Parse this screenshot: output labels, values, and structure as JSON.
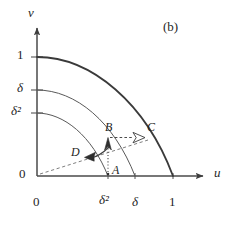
{
  "figure": {
    "panel_label": "(b)",
    "axes": {
      "x_axis_name": "u",
      "y_axis_name": "v",
      "origin_label": "0",
      "x_ticks": [
        {
          "label": "0",
          "value": 0,
          "px": 37
        },
        {
          "label": "δ²",
          "value": 0.52,
          "px": 108
        },
        {
          "label": "δ",
          "value": 0.72,
          "px": 135
        },
        {
          "label": "1",
          "value": 1.0,
          "px": 173
        }
      ],
      "y_ticks": [
        {
          "label": "1",
          "value": 1.0,
          "px": 57
        },
        {
          "label": "δ",
          "value": 0.72,
          "px": 90
        },
        {
          "label": "δ²",
          "value": 0.52,
          "px": 113
        },
        {
          "label": "0",
          "value": 0,
          "px": 176
        }
      ]
    },
    "arcs": [
      {
        "name": "unit-arc",
        "radius_label": "1",
        "radius_px": 136,
        "stroke": "#3a3a3a",
        "width": 1.7
      },
      {
        "name": "delta-arc",
        "radius_label": "δ",
        "radius_px": 98,
        "stroke": "#5a5a5a",
        "width": 1.0
      },
      {
        "name": "delta-squared-arc",
        "radius_label": "δ²",
        "radius_px": 71,
        "stroke": "#5a5a5a",
        "width": 1.0
      }
    ],
    "points": [
      {
        "name": "A",
        "label": "A",
        "u": 0.52,
        "v": 0.0
      },
      {
        "name": "B",
        "label": "B",
        "u": 0.52,
        "v": 0.27
      },
      {
        "name": "C",
        "label": "C",
        "u": 0.77,
        "v": 0.26
      },
      {
        "name": "D",
        "label": "D",
        "u": 0.35,
        "v": 0.155
      }
    ],
    "connectors": [
      {
        "name": "A-to-B",
        "style": "dotted",
        "from": "A",
        "to": "B",
        "arrow": true
      },
      {
        "name": "B-to-C",
        "style": "dashed",
        "from": "B",
        "to": "C",
        "arrow": true
      },
      {
        "name": "origin-to-C",
        "style": "dashed",
        "from": "origin",
        "to": "C",
        "arrow": false
      },
      {
        "name": "B-to-D",
        "style": "solid-arc",
        "from": "B",
        "to": "D",
        "arrow": true
      }
    ],
    "colors": {
      "ink": "#1f1f1f",
      "axis": "#4a4a4a",
      "curve_bold": "#3a3a3a",
      "curve_thin": "#5a5a5a",
      "guide": "#6b6b6b",
      "background": "#ffffff"
    }
  }
}
